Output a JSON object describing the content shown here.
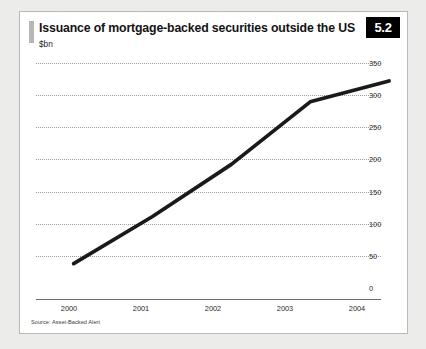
{
  "figure": {
    "badge_label": "5.2",
    "title": "Issuance of mortgage-backed securities outside the US",
    "subtitle": "$bn",
    "source_note": "Source: Asset-Backed Alert"
  },
  "colors": {
    "page_background": "#ececeb",
    "card_background": "#ffffff",
    "card_border": "#b9b9b7",
    "badge_background": "#000000",
    "badge_text": "#ffffff",
    "title_accent": "#b7b7b5",
    "series_line": "#1a1a1a",
    "gridline": "#9a9a98",
    "axis_line": "#6d6d6b"
  },
  "chart_data": {
    "type": "line",
    "title": "Issuance of mortgage-backed securities outside the US",
    "subtitle": "$bn",
    "xlabel": "",
    "ylabel": "$bn",
    "categories": [
      "2000",
      "2001",
      "2002",
      "2003",
      "2004"
    ],
    "x": [
      2000,
      2001,
      2002,
      2003,
      2004
    ],
    "series": [
      {
        "name": "Issuance of mortgage-backed securities outside the US",
        "values": [
          67,
          135,
          210,
          300,
          330
        ]
      }
    ],
    "ylim": [
      0,
      350
    ],
    "yticks": [
      0,
      50,
      100,
      150,
      200,
      250,
      300,
      350
    ],
    "ytick_labels": [
      "0",
      "50",
      "100",
      "150",
      "200",
      "250",
      "300",
      "350"
    ],
    "xtick_labels": [
      "2000",
      "2001",
      "2002",
      "2003",
      "2004"
    ],
    "y_axis_position": "right",
    "grid": true,
    "grid_style": "dotted-horizontal",
    "legend": false,
    "legend_position": "none",
    "source": "Source: Asset-Backed Alert"
  }
}
